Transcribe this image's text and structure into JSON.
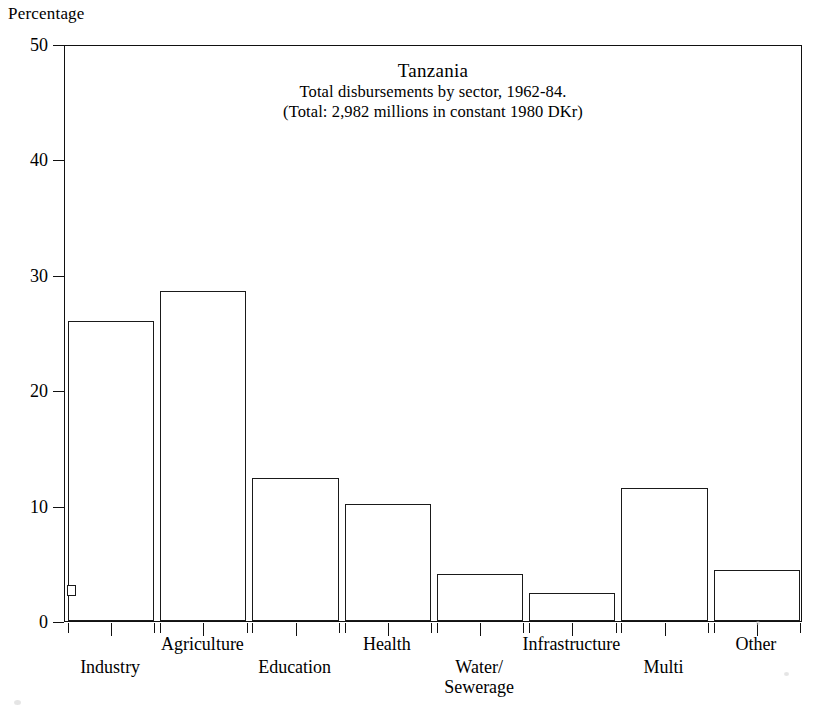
{
  "axis_caption": "Percentage",
  "chart_data": {
    "type": "bar",
    "title": "Tanzania",
    "subtitle_lines": [
      "Total disbursements by sector, 1962-84.",
      "(Total: 2,982 millions in constant 1980 DKr)"
    ],
    "xlabel": "",
    "ylabel": "Percentage",
    "ylim": [
      0,
      50
    ],
    "yticks": [
      0,
      10,
      20,
      30,
      40,
      50
    ],
    "ytick_labels": [
      "0",
      "10",
      "20",
      "30",
      "40",
      "50"
    ],
    "grid": false,
    "legend": "none",
    "bar_style": "outlined-unfilled",
    "categories": [
      "Industry",
      "Agriculture",
      "Education",
      "Health",
      "Water/\nSewerage",
      "Infrastructure",
      "Multi",
      "Other"
    ],
    "values": [
      26.0,
      28.6,
      12.4,
      10.1,
      4.1,
      2.4,
      11.5,
      4.4
    ],
    "annotations": [
      "small rectangular notch artifact on left edge of Industry bar near 3%"
    ]
  }
}
